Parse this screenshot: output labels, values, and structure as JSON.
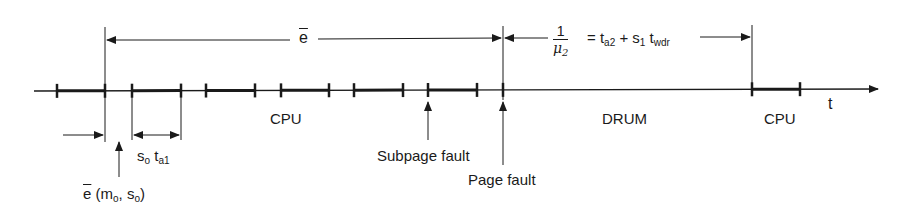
{
  "diagram": {
    "axis_label": "t",
    "segments": {
      "cpu_left": "CPU",
      "drum": "DRUM",
      "cpu_right": "CPU"
    },
    "annotations": {
      "e_bar": "e",
      "mu_num": "1",
      "mu_den": "μ",
      "mu_den_sub": "2",
      "mu_rhs_eq": "= t",
      "mu_rhs_ta_sub": "a2",
      "mu_rhs_plus": " + s",
      "mu_rhs_s_sub": "1",
      "mu_rhs_t": " t",
      "mu_rhs_t_sub": "wdr",
      "so_ta1_s": "s",
      "so_ta1_s_sub": "o",
      "so_ta1_t": " t",
      "so_ta1_t_sub": "a1",
      "e_func_e": "e",
      "e_func_open": " (m",
      "e_func_m_sub": "o",
      "e_func_mid": ", s",
      "e_func_s_sub": "o",
      "e_func_close": ")",
      "subpage_fault": "Subpage fault",
      "page_fault": "Page fault"
    },
    "ticks_x": [
      57,
      105,
      132,
      181,
      206,
      255,
      281,
      329,
      354,
      403,
      428,
      477,
      503,
      752,
      800
    ],
    "thick_segments": [
      [
        57,
        105
      ],
      [
        132,
        181
      ],
      [
        206,
        255
      ],
      [
        281,
        329
      ],
      [
        354,
        403
      ],
      [
        428,
        477
      ],
      [
        752,
        800
      ]
    ],
    "color": "#1a1a1a"
  }
}
